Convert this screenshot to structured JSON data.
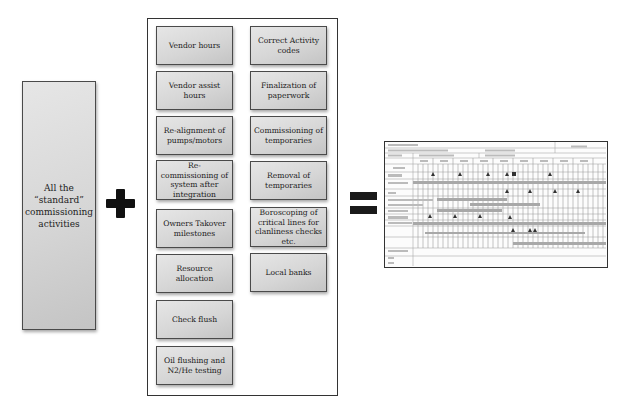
{
  "left_box": {
    "label": "All the “standard” commissioning activities"
  },
  "operators": {
    "plus": "plus-icon",
    "equals": "equals-icon"
  },
  "activities": {
    "left_column": [
      "Vendor hours",
      "Vendor assist hours",
      "Re-alignment of pumps/motors",
      "Re-commissioning of system after integration",
      "Owners Takover milestones",
      "Resource allocation",
      "Check flush",
      "Oil flushing and N2/He testing"
    ],
    "right_column": [
      "Correct Activity codes",
      "Finalization of paperwork",
      "Commissioning of temporaries",
      "Removal of temporaries",
      "Boroscoping of critical lines for clanliness checks etc.",
      "Local banks"
    ]
  },
  "result": {
    "description": "commissioning schedule form thumbnail"
  },
  "colors": {
    "box_gradient_light": "#e6e6e6",
    "box_gradient_dark": "#c4c4c4",
    "border": "#333333",
    "operator": "#111111"
  }
}
